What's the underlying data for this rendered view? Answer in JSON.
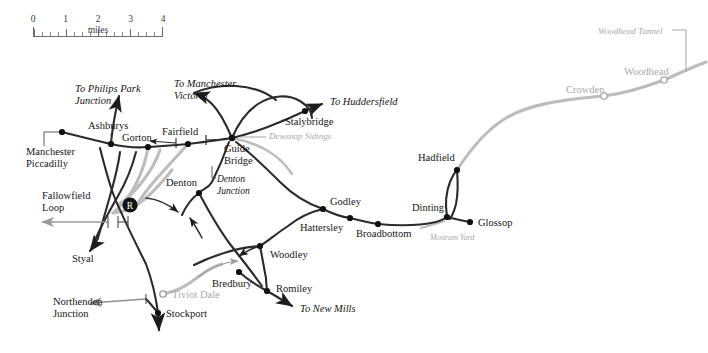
{
  "map": {
    "title": "Woodhead Route and Manchester area railway map",
    "background": "#ffffff",
    "line_colors": {
      "open_line": "#2b2b2b",
      "closed_line": "#bdbdbd",
      "label_text": "#161616",
      "closed_label_text": "#a9a9a9",
      "annotation_text": "#6f6f6f"
    }
  },
  "scale": {
    "unit_label": "miles",
    "ticks": [
      "0",
      "1",
      "2",
      "3",
      "4"
    ],
    "minor_divisions_per_mile": 4
  },
  "stations": [
    {
      "name": "Manchester Piccadilly",
      "status": "open",
      "marker": "filled",
      "x": 62,
      "y": 132
    },
    {
      "name": "Ashburys",
      "status": "open",
      "marker": "filled",
      "x": 111,
      "y": 144
    },
    {
      "name": "Gorton",
      "status": "open",
      "marker": "filled",
      "x": 148,
      "y": 147
    },
    {
      "name": "Fairfield",
      "status": "open",
      "marker": "filled",
      "x": 188,
      "y": 144
    },
    {
      "name": "Guide Bridge",
      "status": "open",
      "marker": "filled",
      "x": 232,
      "y": 138
    },
    {
      "name": "Stalybridge",
      "status": "open",
      "marker": "filled",
      "x": 305,
      "y": 111
    },
    {
      "name": "Denton",
      "status": "open",
      "marker": "filled",
      "x": 199,
      "y": 193
    },
    {
      "name": "Godley",
      "status": "open",
      "marker": "filled",
      "x": 323,
      "y": 209
    },
    {
      "name": "Hattersley",
      "status": "open",
      "marker": "filled",
      "x": 350,
      "y": 218
    },
    {
      "name": "Broadbottom",
      "status": "open",
      "marker": "filled",
      "x": 378,
      "y": 224
    },
    {
      "name": "Dinting",
      "status": "open",
      "marker": "filled",
      "x": 447,
      "y": 217
    },
    {
      "name": "Glossop",
      "status": "open",
      "marker": "filled",
      "x": 470,
      "y": 222
    },
    {
      "name": "Hadfield",
      "status": "open",
      "marker": "filled",
      "x": 457,
      "y": 170
    },
    {
      "name": "Woodley",
      "status": "open",
      "marker": "filled",
      "x": 260,
      "y": 246
    },
    {
      "name": "Bredbury",
      "status": "open",
      "marker": "filled",
      "x": 239,
      "y": 272
    },
    {
      "name": "Romiley",
      "status": "open",
      "marker": "filled",
      "x": 267,
      "y": 291
    },
    {
      "name": "Stockport",
      "status": "open",
      "marker": "filled",
      "x": 158,
      "y": 313
    },
    {
      "name": "Tiviot Dale",
      "status": "closed",
      "marker": "hollow",
      "x": 163,
      "y": 294
    },
    {
      "name": "Crowden",
      "status": "closed",
      "marker": "hollow",
      "x": 604,
      "y": 96
    },
    {
      "name": "Woodhead",
      "status": "closed",
      "marker": "hollow",
      "x": 664,
      "y": 80
    }
  ],
  "destination_labels": [
    {
      "text": "To Philips Park Junction",
      "style": "italic",
      "x": 75,
      "y": 83
    },
    {
      "text": "To Manchester Victoria",
      "style": "italic",
      "x": 174,
      "y": 78
    },
    {
      "text": "To Huddersfield",
      "style": "italic",
      "x": 330,
      "y": 98
    },
    {
      "text": "To New Mills",
      "style": "italic",
      "x": 300,
      "y": 306
    },
    {
      "text": "Northenden Junction",
      "style": "plain",
      "x": 53,
      "y": 298
    },
    {
      "text": "Styal",
      "style": "plain",
      "x": 72,
      "y": 258
    },
    {
      "text": "Fallowfield Loop",
      "style": "plain",
      "x": 42,
      "y": 192
    }
  ],
  "annotations": [
    {
      "text": "Dewsnap Sidings",
      "style": "italic-grey",
      "x": 269,
      "y": 133
    },
    {
      "text": "Denton Junction",
      "style": "italic",
      "x": 218,
      "y": 175
    },
    {
      "text": "Mottram Yard",
      "style": "italic-grey",
      "x": 432,
      "y": 234
    },
    {
      "text": "Woodhead Tunnel",
      "style": "italic-grey",
      "x": 598,
      "y": 28
    }
  ],
  "markers": [
    {
      "name": "R",
      "description": "Reddish marker roundel",
      "x": 130,
      "y": 205
    }
  ]
}
